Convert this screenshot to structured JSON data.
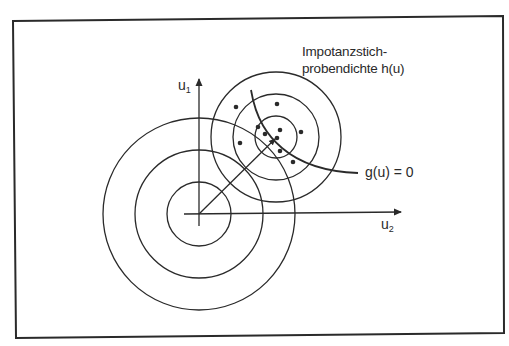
{
  "diagram": {
    "title_line1": "Impotanzstich-",
    "title_line2": "probendichte h(u)",
    "axis_u1": {
      "base": "u",
      "sub": "1"
    },
    "axis_u2": {
      "base": "u",
      "sub": "2"
    },
    "limit_state_label": "g(u) = 0",
    "colors": {
      "stroke": "#2a2a2a",
      "background": "#ffffff",
      "frame": "#2a2a2a"
    },
    "origin_circles": {
      "center": [
        199,
        214
      ],
      "radii": [
        32,
        64,
        96
      ]
    },
    "sampling_circles": {
      "center": [
        276,
        137
      ],
      "radii": [
        21,
        43,
        65
      ]
    },
    "sample_points": [
      [
        236,
        107
      ],
      [
        277,
        104
      ],
      [
        240,
        143
      ],
      [
        258,
        127
      ],
      [
        265,
        134
      ],
      [
        280,
        130
      ],
      [
        301,
        132
      ],
      [
        277,
        138
      ],
      [
        280,
        151
      ],
      [
        293,
        162
      ]
    ]
  }
}
